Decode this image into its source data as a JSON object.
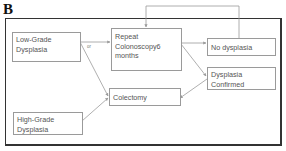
{
  "panel_label": "B",
  "nodes": {
    "low_grade": {
      "line1": "Low-Grade",
      "line2": "Dysplasia"
    },
    "repeat": {
      "line1": "Repeat",
      "line2": "Colonoscopy6",
      "line3": "months"
    },
    "no_dysplasia": {
      "line1": "No dysplasia"
    },
    "dysplasia_confirmed": {
      "line1": "Dysplasia",
      "line2": "Confirmed"
    },
    "colectomy": {
      "line1": "Colectomy"
    },
    "high_grade": {
      "line1": "High-Grade",
      "line2": "Dysplasia"
    }
  },
  "edge_label_or": "or",
  "colors": {
    "box_border": "#9a9a9a",
    "arrow": "#9a9a9a",
    "frame": "#333333",
    "text": "#555555"
  }
}
